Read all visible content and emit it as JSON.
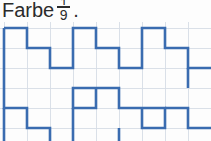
{
  "instruction": {
    "text": "Farbe",
    "fraction": {
      "numerator": "1",
      "denominator": "9"
    },
    "punctuation": "."
  },
  "figure": {
    "stroke_color": "#3a6cb0",
    "grid_color": "#d6dde6",
    "origin_x": 4,
    "origin_y": 6,
    "cell_width": 23,
    "cell_height": 20,
    "cols": 9,
    "rows": 6,
    "paths": [
      "M4,6 L27,6 L27,26 L50,26 L50,46 L73,46 L73,6 L96,6 L96,26 L119,26 L119,46 L142,46 L142,6 L165,6 L165,26 L188,26 L188,46 L211,46",
      "M4,6 L4,86 L27,86 L27,106 L50,106 L50,141",
      "M96,66 L96,86 L73,86 L73,66 L96,66",
      "M96,66 L119,66 L119,86 L142,86 L142,106 L165,106 L165,86 L142,86",
      "M73,86 L73,141",
      "M165,86 L188,86 L188,106 L211,106",
      "M119,106 L119,141",
      "M188,46 L188,66",
      "M4,86 L4,141"
    ]
  }
}
